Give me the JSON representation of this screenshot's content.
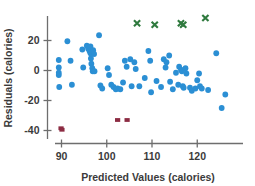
{
  "chart_data": {
    "type": "scatter",
    "title": "",
    "xlabel": "Predicted Values (calories)",
    "ylabel": "Residuals (calories)",
    "xlim": [
      86,
      130
    ],
    "ylim": [
      -45,
      40
    ],
    "xticks": [
      90,
      100,
      110,
      120
    ],
    "yticks": [
      20,
      0,
      -20,
      -40
    ],
    "xtick_labels": [
      "90",
      "100",
      "110",
      "120"
    ],
    "ytick_labels": [
      "20",
      "0",
      "-20",
      "-40"
    ],
    "grid": false,
    "legend": "none",
    "colors": {
      "series_blue": "#2b8fd4",
      "series_green": "#2f7a3e",
      "series_red": "#8c2b42",
      "axis": "#6e6e6e",
      "text": "#3b3b3b",
      "background": "#ffffff"
    },
    "series": [
      {
        "name": "residuals",
        "marker": "circle",
        "color": "#2b8fd4",
        "points": [
          [
            89.4,
            7.0
          ],
          [
            89.4,
            2.0
          ],
          [
            89.4,
            -1.5
          ],
          [
            89.4,
            -3.0
          ],
          [
            89.5,
            -11.0
          ],
          [
            91.3,
            19.5
          ],
          [
            92.0,
            6.5
          ],
          [
            92.3,
            -9.5
          ],
          [
            94.6,
            14.0
          ],
          [
            94.8,
            2.0
          ],
          [
            95.6,
            16.5
          ],
          [
            95.9,
            14.5
          ],
          [
            96.2,
            13.0
          ],
          [
            96.4,
            16.0
          ],
          [
            96.4,
            11.5
          ],
          [
            96.5,
            8.0
          ],
          [
            96.6,
            4.5
          ],
          [
            96.8,
            1.5
          ],
          [
            96.9,
            -0.5
          ],
          [
            97.0,
            13.5
          ],
          [
            97.2,
            11.0
          ],
          [
            97.3,
            -0.5
          ],
          [
            98.3,
            23.5
          ],
          [
            98.6,
            -10.0
          ],
          [
            99.0,
            -12.0
          ],
          [
            100.2,
            1.5
          ],
          [
            100.5,
            -3.0
          ],
          [
            101.0,
            -9.5
          ],
          [
            101.5,
            -11.0
          ],
          [
            102.0,
            -12.5
          ],
          [
            102.4,
            -12.0
          ],
          [
            103.0,
            -12.5
          ],
          [
            103.6,
            -8.0
          ],
          [
            104.0,
            6.5
          ],
          [
            104.4,
            2.5
          ],
          [
            105.2,
            7.5
          ],
          [
            105.5,
            -10.5
          ],
          [
            106.1,
            5.5
          ],
          [
            106.4,
            1.0
          ],
          [
            107.2,
            -10.5
          ],
          [
            108.4,
            -5.0
          ],
          [
            109.2,
            13.0
          ],
          [
            109.6,
            6.5
          ],
          [
            109.8,
            -14.5
          ],
          [
            111.0,
            -7.0
          ],
          [
            112.0,
            -11.0
          ],
          [
            112.6,
            7.5
          ],
          [
            113.0,
            2.0
          ],
          [
            113.2,
            5.5
          ],
          [
            113.8,
            10.0
          ],
          [
            114.0,
            -7.5
          ],
          [
            114.6,
            -12.5
          ],
          [
            115.3,
            -1.5
          ],
          [
            115.8,
            -9.5
          ],
          [
            116.0,
            2.5
          ],
          [
            116.4,
            0.5
          ],
          [
            116.6,
            -0.5
          ],
          [
            116.8,
            -10.5
          ],
          [
            117.0,
            -11.5
          ],
          [
            117.4,
            1.5
          ],
          [
            117.6,
            -2.0
          ],
          [
            118.4,
            -11.5
          ],
          [
            118.8,
            -13.5
          ],
          [
            119.6,
            -12.0
          ],
          [
            120.0,
            -6.5
          ],
          [
            120.4,
            -2.0
          ],
          [
            120.6,
            -10.5
          ],
          [
            121.0,
            -12.0
          ],
          [
            122.4,
            -13.0
          ],
          [
            124.2,
            11.5
          ],
          [
            125.4,
            -25.0
          ],
          [
            126.2,
            -16.0
          ]
        ]
      },
      {
        "name": "high-outliers",
        "marker": "x",
        "color": "#2f7a3e",
        "points": [
          [
            106.7,
            31.5
          ],
          [
            110.6,
            30.5
          ],
          [
            116.4,
            31.5
          ],
          [
            116.9,
            30.5
          ],
          [
            121.8,
            35.0
          ]
        ]
      },
      {
        "name": "low-outliers",
        "marker": "square",
        "color": "#8c2b42",
        "points": [
          [
            89.9,
            -38.5
          ],
          [
            90.1,
            -39.5
          ],
          [
            102.4,
            -33.0
          ],
          [
            104.5,
            -33.0
          ]
        ]
      }
    ]
  }
}
